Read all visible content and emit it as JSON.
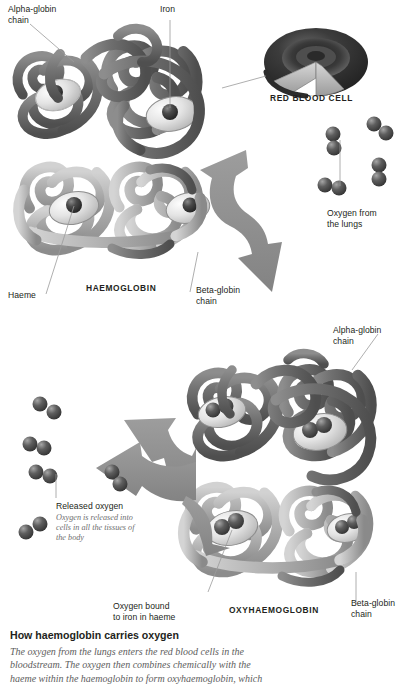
{
  "figure": {
    "title": "How haemoglobin carries oxygen",
    "body": "The oxygen from the lungs enters the red blood cells in the\nbloodstream. The oxygen then combines chemically with the\nhaeme within the haemoglobin to form oxyhaemoglobin, which"
  },
  "top_panel": {
    "alpha_globin": "Alpha-globin\nchain",
    "iron": "Iron",
    "haeme": "Haeme",
    "beta_globin": "Beta-globin\nchain",
    "molecule_name": "HAEMOGLOBIN",
    "red_blood_cell": "RED BLOOD CELL",
    "oxygen_from_lungs": "Oxygen from\nthe lungs"
  },
  "bottom_panel": {
    "alpha_globin": "Alpha-globin\nchain",
    "beta_globin": "Beta-globin\nchain",
    "molecule_name": "OXYHAEMOGLOBIN",
    "released_oxygen": "Released oxygen",
    "released_oxygen_detail": "Oxygen is released into\ncells in all the tissues of\nthe body",
    "oxygen_bound": "Oxygen bound\nto iron in haeme"
  },
  "colors": {
    "background": "#ffffff",
    "chain_dark": "#6f6f6f",
    "chain_light": "#b3b3b3",
    "chain_dark_shade": "#585858",
    "chain_light_shade": "#949494",
    "haeme_disc": "#e9e9e9",
    "iron_sphere": "#3a3a3a",
    "oxygen_sphere": "#5a5a5a",
    "arrow": "#8f8f8f",
    "rbc_dark": "#2c2c2c",
    "rbc_mid": "#555555",
    "leader_line": "#9a9a9a",
    "text": "#231f20",
    "text_muted": "#6e6e6e"
  }
}
